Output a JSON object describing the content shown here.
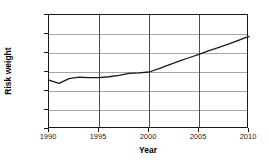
{
  "chart_data": {
    "type": "line",
    "title": "",
    "xlabel": "Year",
    "ylabel": "Risk weight",
    "xlim": [
      1990,
      2010
    ],
    "ylim": [
      0,
      12000
    ],
    "grid": true,
    "legend": false,
    "legend_position": "none",
    "line_color": "#1a1a1a",
    "x_ticks": [
      1990,
      1995,
      2000,
      2005,
      2010
    ],
    "x_tick_labels": [
      "1990",
      "1995",
      "2000",
      "2005",
      "2010"
    ],
    "y_ticks": [
      0,
      2000,
      4000,
      6000,
      8000,
      10000,
      12000
    ],
    "y_tick_labels": [
      "0",
      "2000",
      "4000",
      "6000",
      "8000",
      "10000",
      "12000"
    ],
    "series": [
      {
        "name": "Risk weight",
        "x": [
          1990,
          1991,
          1992,
          1993,
          1994,
          1995,
          1996,
          1997,
          1998,
          1999,
          2000,
          2001,
          2002,
          2003,
          2004,
          2005,
          2006,
          2007,
          2008,
          2009,
          2010
        ],
        "values": [
          5150,
          4800,
          5300,
          5450,
          5400,
          5400,
          5500,
          5650,
          5850,
          5900,
          6000,
          6350,
          6750,
          7150,
          7500,
          7850,
          8250,
          8600,
          8950,
          9350,
          9750
        ]
      }
    ]
  }
}
